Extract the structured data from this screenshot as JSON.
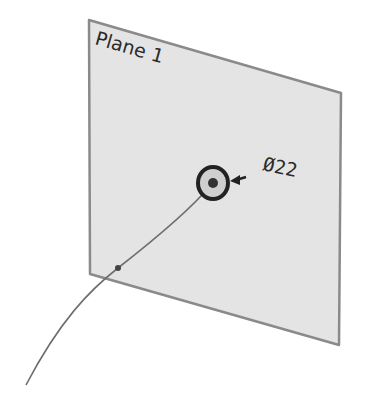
{
  "diagram": {
    "plane": {
      "label": "Plane 1",
      "fill": "#e4e4e4",
      "stroke": "#8a8a8a"
    },
    "hole": {
      "dimension_label": "Ø22",
      "stroke": "#222222"
    },
    "curve": {
      "stroke": "#6e6e6e"
    }
  }
}
